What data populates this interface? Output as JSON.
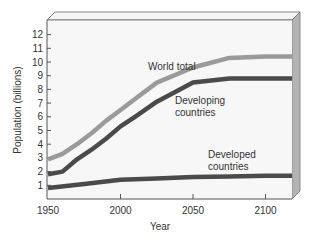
{
  "chart_data": {
    "type": "line",
    "title": "",
    "xlabel": "Year",
    "ylabel": "Population (billions)",
    "xlim": [
      1950,
      2120
    ],
    "ylim": [
      0,
      13
    ],
    "x_ticks": [
      "1950",
      "2000",
      "2050",
      "2100"
    ],
    "y_ticks": [
      "1",
      "2",
      "3",
      "4",
      "5",
      "6",
      "7",
      "8",
      "9",
      "10",
      "11",
      "12"
    ],
    "grid": false,
    "legend": "inline annotations",
    "series": [
      {
        "name": "World total",
        "color": "#9a9a9a",
        "x": [
          1950,
          1960,
          1970,
          1980,
          1990,
          2000,
          2010,
          2025,
          2050,
          2075,
          2100,
          2120
        ],
        "values": [
          2.9,
          3.3,
          4.0,
          4.8,
          5.7,
          6.5,
          7.3,
          8.5,
          9.6,
          10.3,
          10.4,
          10.4
        ]
      },
      {
        "name": "Developing countries",
        "color": "#4a4a4a",
        "x": [
          1950,
          1960,
          1970,
          1980,
          1990,
          2000,
          2010,
          2025,
          2050,
          2075,
          2100,
          2120
        ],
        "values": [
          1.8,
          2.0,
          2.9,
          3.6,
          4.4,
          5.3,
          6.0,
          7.1,
          8.5,
          8.8,
          8.8,
          8.8
        ]
      },
      {
        "name": "Developed countries",
        "color": "#4a4a4a",
        "x": [
          1950,
          1975,
          2000,
          2025,
          2050,
          2075,
          2100,
          2120
        ],
        "values": [
          0.8,
          1.1,
          1.4,
          1.5,
          1.6,
          1.65,
          1.7,
          1.7
        ]
      }
    ],
    "annotations": [
      {
        "text": "World total",
        "x": 2010,
        "y": 9.9
      },
      {
        "text": "Developing countries",
        "x": 2040,
        "y": 6.9
      },
      {
        "text": "Developed countries",
        "x": 2060,
        "y": 2.7
      }
    ]
  },
  "labels": {
    "world_total": "World total",
    "developing_1": "Developing",
    "developing_2": "countries",
    "developed_1": "Developed",
    "developed_2": "countries",
    "xlabel": "Year",
    "ylabel": "Population (billions)"
  }
}
